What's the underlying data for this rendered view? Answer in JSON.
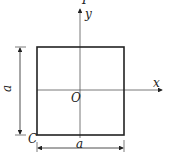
{
  "diagram": {
    "labels": {
      "load": "P",
      "y_axis": "y",
      "x_axis": "x",
      "origin": "O",
      "corner": "C",
      "height_dim": "a",
      "width_dim": "a"
    },
    "colors": {
      "stroke": "#222222",
      "axis": "#555555"
    }
  }
}
